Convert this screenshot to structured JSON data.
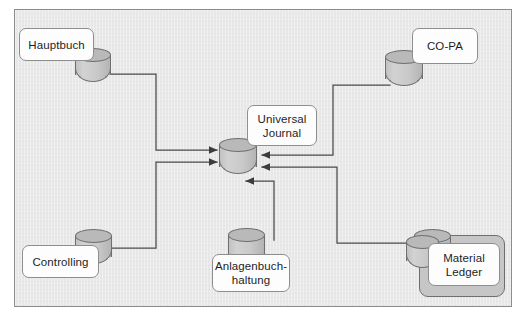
{
  "diagram": {
    "canvas": {
      "background_color": "#e8e8e8",
      "border_color": "#8c8c8c"
    },
    "style": {
      "card_fill": "#fdfdfd",
      "card_stroke": "#8e8e8e",
      "cylinder_fill": "#c9c9c9",
      "cylinder_stroke": "#6f6f6f",
      "plate_fill": "#c6c6c6",
      "connector_color": "#4a4a4a"
    },
    "nodes": [
      {
        "id": "hauptbuch",
        "label": "Hauptbuch"
      },
      {
        "id": "controlling",
        "label": "Controlling"
      },
      {
        "id": "universal-journal",
        "label": "Universal\nJournal"
      },
      {
        "id": "anlagenbuchhaltung",
        "label": "Anlagenbuch-\nhaltung"
      },
      {
        "id": "co-pa",
        "label": "CO-PA"
      },
      {
        "id": "material-ledger",
        "label": "Material\nLedger"
      }
    ],
    "edges": [
      {
        "from": "hauptbuch",
        "to": "universal-journal",
        "direction": "to-target"
      },
      {
        "from": "controlling",
        "to": "universal-journal",
        "direction": "to-target"
      },
      {
        "from": "co-pa",
        "to": "universal-journal",
        "direction": "to-target"
      },
      {
        "from": "material-ledger",
        "to": "universal-journal",
        "direction": "to-target"
      },
      {
        "from": "anlagenbuchhaltung",
        "to": "universal-journal",
        "direction": "to-target"
      }
    ]
  }
}
